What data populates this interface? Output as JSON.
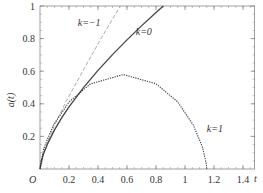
{
  "chart_data": {
    "type": "line",
    "title": "",
    "xlabel": "t",
    "ylabel": "a(t)",
    "origin_label": "O",
    "xlim": [
      0,
      1.48
    ],
    "ylim": [
      0,
      1
    ],
    "x_ticks": [
      0.2,
      0.4,
      0.6,
      0.8,
      1,
      1.2,
      1.4
    ],
    "x_tick_labels": [
      "0.2",
      "0.4",
      "0.6",
      "0.8",
      "1",
      "1.2",
      "1.4"
    ],
    "y_ticks": [
      0.2,
      0.4,
      0.6,
      0.8,
      1
    ],
    "y_tick_labels": [
      "0.2",
      "0.4",
      "0.6",
      "0.8",
      "1"
    ],
    "grid": false,
    "legend": "inline labels",
    "series": [
      {
        "name": "k=−1",
        "style": "dashed",
        "color": "#aaaaaa",
        "label_pos": [
          0.26,
          0.88
        ],
        "points": [
          [
            0,
            0
          ],
          [
            0.0034,
            0.0255
          ],
          [
            0.0282,
            0.1086
          ],
          [
            0.101,
            0.2705
          ],
          [
            0.184,
            0.4215
          ],
          [
            0.309,
            0.623
          ],
          [
            0.425,
            0.807
          ],
          [
            0.554,
            1.0
          ]
        ]
      },
      {
        "name": "k=0",
        "style": "solid",
        "color": "#444444",
        "label_pos": [
          0.66,
          0.82
        ],
        "points": [
          [
            0,
            0
          ],
          [
            0.02,
            0.082
          ],
          [
            0.05,
            0.151
          ],
          [
            0.1,
            0.24
          ],
          [
            0.15,
            0.315
          ],
          [
            0.2,
            0.381
          ],
          [
            0.3,
            0.499
          ],
          [
            0.4,
            0.605
          ],
          [
            0.5,
            0.702
          ],
          [
            0.6,
            0.792
          ],
          [
            0.7,
            0.878
          ],
          [
            0.8,
            0.96
          ],
          [
            0.85,
            1.0
          ]
        ]
      },
      {
        "name": "k=1",
        "style": "dotted",
        "color": "#333333",
        "label_pos": [
          1.15,
          0.23
        ],
        "points": [
          [
            0,
            0
          ],
          [
            0.0038,
            0.0355
          ],
          [
            0.029,
            0.133
          ],
          [
            0.092,
            0.269
          ],
          [
            0.2,
            0.411
          ],
          [
            0.348,
            0.522
          ],
          [
            0.575,
            0.58
          ],
          [
            0.801,
            0.523
          ],
          [
            0.949,
            0.412
          ],
          [
            1.057,
            0.27
          ],
          [
            1.121,
            0.134
          ],
          [
            1.146,
            0.0358
          ],
          [
            1.15,
            0
          ]
        ]
      }
    ]
  }
}
